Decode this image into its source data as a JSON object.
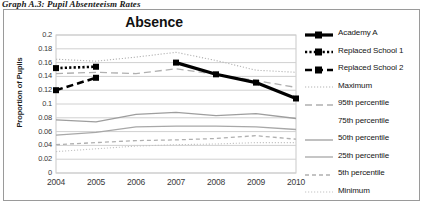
{
  "caption": "Graph A.3: Pupil Absenteeism Rates",
  "chart_data": {
    "type": "line",
    "title": "Absence",
    "xlabel": "",
    "ylabel": "Proportion of Pupils",
    "x": [
      2004,
      2005,
      2006,
      2007,
      2008,
      2009,
      2010
    ],
    "categories": [
      "2004",
      "2005",
      "2006",
      "2007",
      "2008",
      "2009",
      "2010"
    ],
    "ylim": [
      0,
      0.2
    ],
    "yticks": [
      "0",
      "0.02",
      "0.04",
      "0.06",
      "0.08",
      "0.1",
      "0.12",
      "0.14",
      "0.16",
      "0.18",
      "0.2"
    ],
    "ytick_values": [
      0,
      0.02,
      0.04,
      0.06,
      0.08,
      0.1,
      0.12,
      0.14,
      0.16,
      0.18,
      0.2
    ],
    "grid": true,
    "legend_position": "right",
    "series": [
      {
        "name": "Academy A",
        "style": "solid-thick-marker",
        "color": "#000000",
        "values": [
          null,
          null,
          null,
          0.16,
          0.143,
          0.131,
          0.108
        ]
      },
      {
        "name": "Replaced School 1",
        "style": "dotted-marker",
        "color": "#000000",
        "values": [
          0.152,
          0.154,
          null,
          null,
          null,
          null,
          null
        ]
      },
      {
        "name": "Replaced School 2",
        "style": "dashed-marker",
        "color": "#000000",
        "values": [
          0.12,
          0.138,
          null,
          null,
          null,
          null,
          null
        ]
      },
      {
        "name": "Maximum",
        "style": "fine-dotted",
        "color": "#b4b4b4",
        "values": [
          0.165,
          0.162,
          0.168,
          0.175,
          0.163,
          0.149,
          0.146
        ]
      },
      {
        "name": "95th percentile",
        "style": "long-dashed",
        "color": "#b0b0b0",
        "values": [
          0.144,
          0.146,
          0.144,
          0.151,
          0.143,
          0.134,
          0.124
        ]
      },
      {
        "name": "75th percentile",
        "style": "none",
        "color": "#bdbdbd",
        "values": [
          null,
          null,
          null,
          null,
          null,
          null,
          null
        ]
      },
      {
        "name": "50th percentile",
        "style": "solid-thin",
        "color": "#9e9e9e",
        "values": [
          0.077,
          0.074,
          0.085,
          0.088,
          0.083,
          0.086,
          0.079
        ]
      },
      {
        "name": "25th percentile",
        "style": "solid-thin",
        "color": "#a8a8a8",
        "values": [
          0.055,
          0.059,
          0.067,
          0.068,
          0.068,
          0.067,
          0.063
        ]
      },
      {
        "name": "5th percentile",
        "style": "short-dashed",
        "color": "#b0b0b0",
        "values": [
          0.041,
          0.044,
          0.047,
          0.048,
          0.05,
          0.054,
          0.049
        ]
      },
      {
        "name": "Minimum",
        "style": "fine-dotted",
        "color": "#c4c4c4",
        "values": [
          0.031,
          0.035,
          0.039,
          0.041,
          0.042,
          0.044,
          0.044
        ]
      }
    ]
  }
}
